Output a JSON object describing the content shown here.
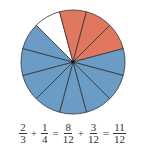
{
  "diagram": {
    "type": "fraction-circle",
    "total_slices": 12,
    "start_angle_deg": -45,
    "slices": [
      "white",
      "red",
      "red",
      "red",
      "blue",
      "blue",
      "blue",
      "blue",
      "blue",
      "blue",
      "blue",
      "blue"
    ],
    "colors": {
      "red": "#e0785f",
      "blue": "#6a9cc6",
      "white": "#ffffff",
      "stroke": "#333333"
    }
  },
  "equation": {
    "terms": [
      {
        "num": "2",
        "den": "3"
      },
      {
        "op": "+"
      },
      {
        "num": "1",
        "den": "4"
      },
      {
        "op": "="
      },
      {
        "num": "8",
        "den": "12"
      },
      {
        "op": "+"
      },
      {
        "num": "3",
        "den": "12"
      },
      {
        "op": "="
      },
      {
        "num": "11",
        "den": "12"
      }
    ]
  }
}
